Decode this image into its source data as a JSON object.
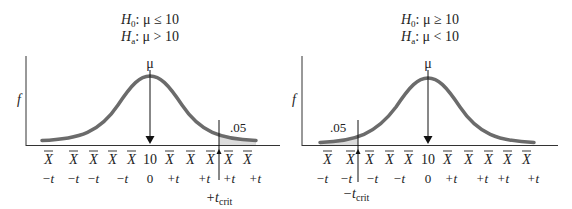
{
  "panels": [
    {
      "id": "right-tailed",
      "h0_symbol": "H",
      "h0_sub": "0",
      "h0_rest": ": μ ≤ 10",
      "ha_symbol": "H",
      "ha_sub": "a",
      "ha_rest": ": μ > 10",
      "mu_label": "μ",
      "y_label": "f",
      "alpha_label": ".05",
      "xbar_labels": [
        "X",
        "X",
        "X",
        "X",
        "X",
        "10",
        "X",
        "X",
        "X",
        "X",
        "X"
      ],
      "t_labels": [
        "−t",
        "−t",
        "−t",
        "−t",
        "0",
        "+t",
        "+t",
        "+t",
        "+t"
      ],
      "crit_prefix": "+t",
      "crit_sub": "crit"
    },
    {
      "id": "left-tailed",
      "h0_symbol": "H",
      "h0_sub": "0",
      "h0_rest": ": μ ≥ 10",
      "ha_symbol": "H",
      "ha_sub": "a",
      "ha_rest": ": μ < 10",
      "mu_label": "μ",
      "y_label": "f",
      "alpha_label": ".05",
      "xbar_labels": [
        "X",
        "X",
        "X",
        "X",
        "X",
        "10",
        "X",
        "X",
        "X",
        "X",
        "X"
      ],
      "t_labels": [
        "−t",
        "−t",
        "−t",
        "−t",
        "0",
        "+t",
        "+t",
        "+t",
        "+t"
      ],
      "crit_prefix": "−t",
      "crit_sub": "crit"
    }
  ],
  "colors": {
    "curve": "#6b6b6b",
    "axis": "#333333",
    "shade": "#d9d9d9",
    "text": "#222222"
  }
}
